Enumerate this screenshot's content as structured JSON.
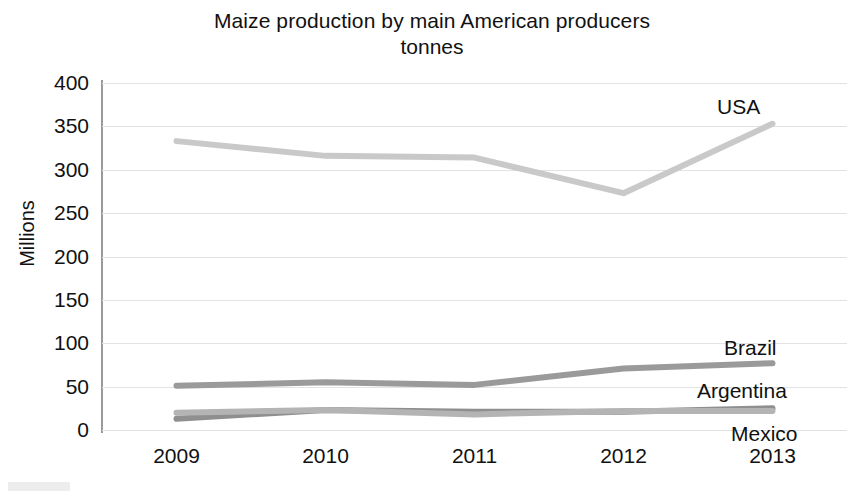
{
  "chart_data": {
    "type": "line",
    "title": "Maize production by main American producers",
    "subtitle": "tonnes",
    "xlabel": "",
    "ylabel": "Millions",
    "categories": [
      "2009",
      "2010",
      "2011",
      "2012",
      "2013"
    ],
    "x": [
      2009,
      2010,
      2011,
      2012,
      2013
    ],
    "ylim": [
      0,
      400
    ],
    "yticks": [
      0,
      50,
      100,
      150,
      200,
      250,
      300,
      350,
      400
    ],
    "ytick_labels": [
      "0",
      "50",
      "100",
      "150",
      "200",
      "250",
      "300",
      "350",
      "400"
    ],
    "grid": true,
    "legend_position": "inline-right-end-labels",
    "series": [
      {
        "name": "USA",
        "color": "#c9c9c9",
        "values": [
          333,
          316,
          314,
          273,
          353
        ],
        "label": "USA"
      },
      {
        "name": "Brazil",
        "color": "#9a9a9a",
        "values": [
          51,
          55,
          52,
          71,
          77
        ],
        "label": "Brazil"
      },
      {
        "name": "Argentina",
        "color": "#8f8f8f",
        "values": [
          13,
          23,
          21,
          21,
          25
        ],
        "label": "Argentina"
      },
      {
        "name": "Mexico",
        "color": "#b4b4b4",
        "values": [
          20,
          23,
          18,
          22,
          22
        ],
        "label": "Mexico"
      }
    ]
  },
  "axis": {
    "y_title": "Millions"
  },
  "labels": {
    "usa": "USA",
    "brazil": "Brazil",
    "argentina": "Argentina",
    "mexico": "Mexico"
  }
}
